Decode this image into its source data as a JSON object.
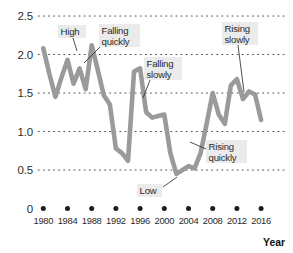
{
  "chart_data": {
    "type": "line",
    "title": "",
    "subtitle": "",
    "xlabel": "Year",
    "ylabel": "",
    "xlim": [
      1980,
      2017
    ],
    "ylim": [
      0,
      2.5
    ],
    "grid": true,
    "grid_style": "dotted-horizontal",
    "legend": false,
    "line_color": "#9a9a9a",
    "x": [
      1980,
      1981,
      1982,
      1983,
      1984,
      1985,
      1986,
      1987,
      1988,
      1989,
      1990,
      1991,
      1992,
      1993,
      1994,
      1995,
      1996,
      1997,
      1998,
      1999,
      2000,
      2001,
      2002,
      2003,
      2004,
      2005,
      2006,
      2007,
      2008,
      2009,
      2010,
      2011,
      2012,
      2013,
      2014,
      2015,
      2016
    ],
    "values": [
      2.08,
      1.75,
      1.45,
      1.7,
      1.93,
      1.62,
      1.82,
      1.55,
      2.12,
      1.8,
      1.47,
      1.35,
      0.78,
      0.72,
      0.62,
      1.78,
      1.82,
      1.25,
      1.18,
      1.2,
      1.22,
      0.72,
      0.45,
      0.5,
      0.55,
      0.52,
      0.72,
      1.1,
      1.5,
      1.22,
      1.1,
      1.6,
      1.68,
      1.42,
      1.52,
      1.48,
      1.15
    ],
    "xticks": [
      1980,
      1984,
      1988,
      1992,
      1996,
      2000,
      2004,
      2008,
      2012,
      2016
    ],
    "xtick_labels": [
      "1980",
      "1984",
      "1988",
      "1992",
      "1996",
      "2000",
      "2004",
      "2008",
      "2012",
      "2016"
    ],
    "yticks": [
      0,
      0.5,
      1.0,
      1.5,
      2.0,
      2.5
    ],
    "ytick_labels": [
      "0",
      "0.5",
      "1.0",
      "1.5",
      "2.0",
      "2.5"
    ],
    "annotations": [
      {
        "label": "High",
        "lines": [
          "High"
        ],
        "box_x": 58,
        "box_y": 25,
        "box_w": 28,
        "box_h": 13,
        "leader": [
          [
            73,
            38
          ],
          [
            77,
            51
          ]
        ]
      },
      {
        "label": "Falling quickly",
        "lines": [
          "Falling",
          "quickly"
        ],
        "box_x": 99,
        "box_y": 24,
        "box_w": 41,
        "box_h": 23,
        "leader": [
          [
            100,
            47
          ],
          [
            84,
            63
          ]
        ]
      },
      {
        "label": "Falling slowly",
        "lines": [
          "Falling",
          "slowly"
        ],
        "box_x": 144,
        "box_y": 57,
        "box_w": 38,
        "box_h": 23,
        "leader": [
          [
            150,
            80
          ],
          [
            143,
            98
          ]
        ]
      },
      {
        "label": "Rising slowly",
        "lines": [
          "Rising",
          "slowly"
        ],
        "box_x": 222,
        "box_y": 22,
        "box_w": 36,
        "box_h": 23,
        "leader": [
          [
            238,
            45
          ],
          [
            244,
            92
          ]
        ]
      },
      {
        "label": "Rising quickly",
        "lines": [
          "Rising",
          "quickly"
        ],
        "box_x": 206,
        "box_y": 140,
        "box_w": 41,
        "box_h": 23,
        "leader": [
          [
            206,
            149
          ],
          [
            190,
            142
          ]
        ]
      },
      {
        "label": "Low",
        "lines": [
          "Low"
        ],
        "box_x": 137,
        "box_y": 184,
        "box_w": 25,
        "box_h": 13,
        "leader": [
          [
            163,
            187
          ],
          [
            177,
            177
          ]
        ]
      }
    ]
  },
  "axes": {
    "x_axis_title": "Year"
  }
}
